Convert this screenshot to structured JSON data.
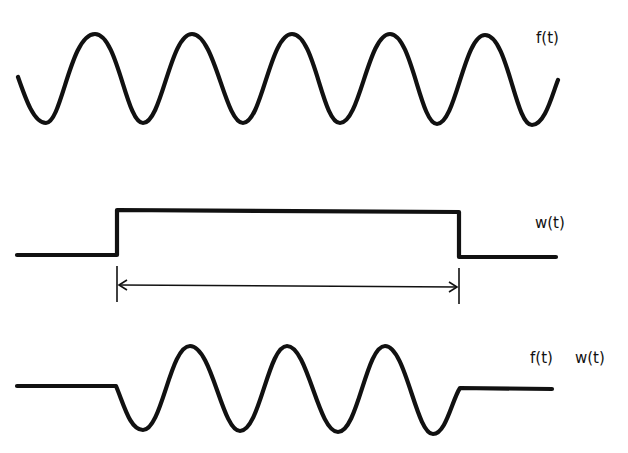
{
  "figure": {
    "background": "#ffffff",
    "stroke_color": "#111111",
    "panels": [
      {
        "id": "signal",
        "label": "f(t)",
        "description": "continuous sinusoid",
        "cycles_visible": 5
      },
      {
        "id": "window",
        "label": "w(t)",
        "description": "rectangular window function",
        "span_annotation": "double-headed arrow marking window width"
      },
      {
        "id": "product",
        "label_f": "f(t)",
        "label_w": "w(t)",
        "description": "windowed sinusoid, flat outside window",
        "cycles_visible": 3
      }
    ]
  }
}
